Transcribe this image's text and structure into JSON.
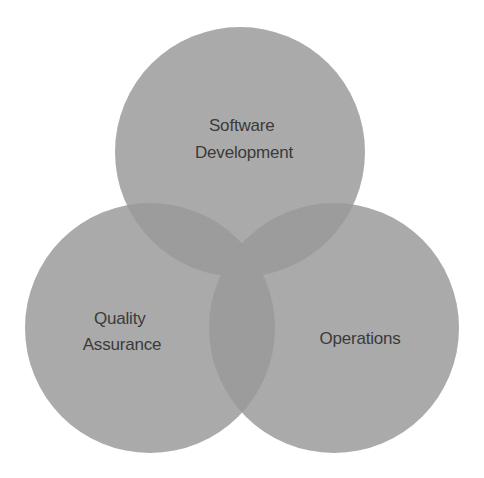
{
  "diagram": {
    "type": "venn",
    "sets": [
      {
        "id": "software_development",
        "lines": [
          "Software",
          "Development"
        ]
      },
      {
        "id": "quality_assurance",
        "lines": [
          "Quality",
          "Assurance"
        ]
      },
      {
        "id": "operations",
        "lines": [
          "Operations"
        ]
      }
    ],
    "colors": {
      "background": "#ffffff",
      "circle_fill": "#a9a9a9",
      "overlap_fill": "#999999",
      "text": "#3a3a3a"
    }
  }
}
